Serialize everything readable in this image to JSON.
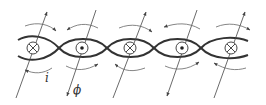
{
  "figure": {
    "labels": {
      "current": "i",
      "flux": "ϕ"
    },
    "loops": [
      {
        "index": 1,
        "symbol": "into-page",
        "flux_arrow": "up"
      },
      {
        "index": 2,
        "symbol": "out-of-page",
        "flux_arrow": "down"
      },
      {
        "index": 3,
        "symbol": "into-page",
        "flux_arrow": "up"
      },
      {
        "index": 4,
        "symbol": "out-of-page",
        "flux_arrow": "down"
      },
      {
        "index": 5,
        "symbol": "into-page",
        "flux_arrow": "up"
      }
    ],
    "colors": {
      "wire": "#333333",
      "lines": "#555555",
      "background": "#ffffff"
    }
  }
}
